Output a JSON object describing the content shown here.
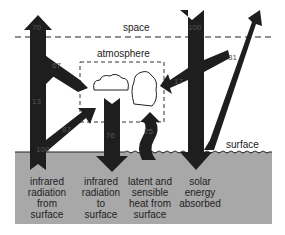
{
  "regions": {
    "space_label": "space",
    "atmosphere_label": "atmosphere",
    "surface_label": "surface"
  },
  "flows": [
    {
      "id": "ir-to-space",
      "value": "70",
      "direction": "up"
    },
    {
      "id": "ir-atmosphere-emission",
      "value": "67",
      "direction": "up-left"
    },
    {
      "id": "ir-window",
      "value": "13",
      "direction": "up"
    },
    {
      "id": "ir-surface-to-atmosphere",
      "value": "87",
      "direction": "up-right"
    },
    {
      "id": "ir-surface-total",
      "value": "100",
      "direction": "up"
    },
    {
      "id": "ir-back-radiation",
      "value": "76",
      "direction": "down"
    },
    {
      "id": "latent-sensible",
      "value": "25",
      "direction": "up"
    },
    {
      "id": "solar-incoming",
      "value": "100",
      "direction": "down"
    },
    {
      "id": "solar-reflected",
      "value": "31",
      "direction": "up-right"
    },
    {
      "id": "solar-absorbed-atmosphere",
      "value": "17",
      "direction": "left"
    }
  ],
  "captions": [
    "infrared\nradiation\nfrom\nsurface",
    "infrared\nradiation\nto\nsurface",
    "latent and\nsensible\nheat from\nsurface",
    "solar\nenergy\nabsorbed"
  ],
  "captions_lines": {
    "c0": [
      "infrared",
      "radiation",
      "from",
      "surface"
    ],
    "c1": [
      "infrared",
      "radiation",
      "to",
      "surface"
    ],
    "c2": [
      "latent and",
      "sensible",
      "heat from",
      "surface"
    ],
    "c3": [
      "solar",
      "energy",
      "absorbed"
    ]
  },
  "colors": {
    "arrow": "#1e1e1e",
    "surface_fill": "#a8a8a8",
    "line": "#222222"
  }
}
